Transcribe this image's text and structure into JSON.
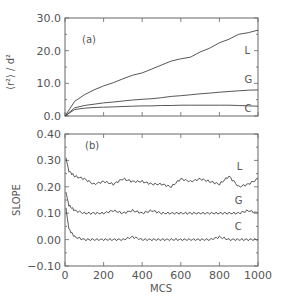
{
  "chart_data": [
    {
      "panel": "(a)",
      "type": "line",
      "title": "",
      "xlabel": "",
      "ylabel": "⟨r²⟩ / d²",
      "xlim": [
        0,
        1000
      ],
      "ylim": [
        0,
        30
      ],
      "yticks": [
        "0.0",
        "10.0",
        "20.0",
        "30.0"
      ],
      "grid": false,
      "x": [
        0,
        50,
        100,
        150,
        200,
        250,
        300,
        350,
        400,
        450,
        500,
        550,
        600,
        650,
        700,
        750,
        800,
        850,
        900,
        950,
        1000
      ],
      "series": [
        {
          "name": "L",
          "values": [
            0,
            4.5,
            6.5,
            8.0,
            9.2,
            10.2,
            11.4,
            12.5,
            13.2,
            14.4,
            15.6,
            16.8,
            17.5,
            18.0,
            19.6,
            20.8,
            22.4,
            23.5,
            25.0,
            25.5,
            26.3
          ]
        },
        {
          "name": "G",
          "values": [
            0,
            2.5,
            3.2,
            3.6,
            4.0,
            4.3,
            4.6,
            4.9,
            5.1,
            5.3,
            5.6,
            6.0,
            6.2,
            6.5,
            6.8,
            7.0,
            7.3,
            7.5,
            7.7,
            7.9,
            8.0
          ]
        },
        {
          "name": "C",
          "values": [
            0,
            2.0,
            2.4,
            2.6,
            2.7,
            2.8,
            2.9,
            3.0,
            3.1,
            3.1,
            3.2,
            3.2,
            3.3,
            3.3,
            3.3,
            3.3,
            3.3,
            3.3,
            3.2,
            3.1,
            3.0
          ]
        }
      ]
    },
    {
      "panel": "(b)",
      "type": "line",
      "title": "",
      "xlabel": "MCS",
      "ylabel": "SLOPE",
      "xlim": [
        0,
        1000
      ],
      "ylim": [
        -0.1,
        0.4
      ],
      "xticks": [
        "0",
        "200",
        "400",
        "600",
        "800",
        "1000"
      ],
      "yticks": [
        "-0.10",
        "0.00",
        "0.10",
        "0.20",
        "0.30",
        "0.40"
      ],
      "grid": false,
      "x": [
        5,
        20,
        50,
        100,
        150,
        200,
        250,
        300,
        350,
        400,
        450,
        500,
        550,
        600,
        650,
        700,
        750,
        800,
        850,
        900,
        950,
        1000
      ],
      "series": [
        {
          "name": "L",
          "values": [
            0.31,
            0.26,
            0.24,
            0.23,
            0.21,
            0.22,
            0.21,
            0.23,
            0.22,
            0.22,
            0.21,
            0.21,
            0.2,
            0.23,
            0.22,
            0.23,
            0.22,
            0.21,
            0.24,
            0.2,
            0.21,
            0.23
          ]
        },
        {
          "name": "G",
          "values": [
            0.18,
            0.13,
            0.11,
            0.1,
            0.1,
            0.1,
            0.11,
            0.1,
            0.11,
            0.1,
            0.11,
            0.1,
            0.1,
            0.1,
            0.1,
            0.1,
            0.1,
            0.1,
            0.1,
            0.1,
            0.11,
            0.1
          ]
        },
        {
          "name": "C",
          "values": [
            0.12,
            0.04,
            0.01,
            0.0,
            0.0,
            0.0,
            0.0,
            0.0,
            0.01,
            0.0,
            0.0,
            0.0,
            0.0,
            0.0,
            0.0,
            0.0,
            0.0,
            0.01,
            0.0,
            0.0,
            0.0,
            0.0
          ]
        }
      ]
    }
  ],
  "labels": {
    "panel_a": "(a)",
    "panel_b": "(b)",
    "top_ylabel": "⟨r²⟩ / d²",
    "bottom_ylabel": "SLOPE",
    "xlabel": "MCS"
  }
}
